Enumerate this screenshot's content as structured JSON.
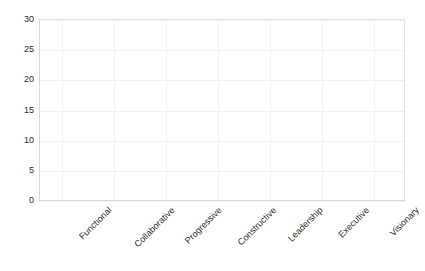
{
  "chart_data": {
    "type": "bar",
    "title": "",
    "subtitle": "",
    "xlabel": "",
    "ylabel": "",
    "categories": [
      "Functional",
      "Collaborative",
      "Progressive",
      "Constructive",
      "Leadership",
      "Executive",
      "Visionary"
    ],
    "values": [
      0,
      0,
      0,
      0,
      0,
      0,
      0
    ],
    "series": [],
    "ylim": [
      0,
      30
    ],
    "yticks": [
      "0",
      "5",
      "10",
      "15",
      "20",
      "25",
      "30"
    ],
    "ytick_values": [
      0,
      5,
      10,
      15,
      20,
      25,
      30
    ],
    "grid": true,
    "grid_color": "#f2f2f2",
    "legend": "none",
    "axis_color": "#d8d8d8",
    "plot_border_color": "#e2e2e2",
    "background_color": "#ffffff",
    "text_color": "#2b2b2b",
    "xtick_rotation": -45,
    "annotations": []
  }
}
